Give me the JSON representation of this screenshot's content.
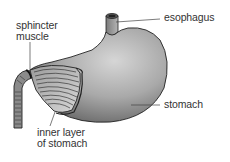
{
  "diagram": {
    "colors": {
      "background": "#ffffff",
      "stomach_fill_light": "#c9c9c9",
      "stomach_fill_dark": "#6e6e6e",
      "outline": "#222222",
      "label_text": "#333333",
      "leader_line": "#444444"
    },
    "labels": {
      "sphincter": {
        "line1": "sphincter",
        "line2": "muscle"
      },
      "esophagus": {
        "text": "esophagus"
      },
      "stomach": {
        "text": "stomach"
      },
      "inner_layer": {
        "line1": "inner layer",
        "line2": "of stomach"
      }
    },
    "icons": {
      "stomach_illustration": "stomach-illustration"
    }
  }
}
